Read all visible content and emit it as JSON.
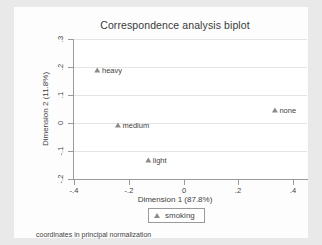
{
  "chart_data": {
    "type": "scatter",
    "title": "Correspondence analysis biplot",
    "xlabel": "Dimension 1 (87.8%)",
    "ylabel": "Dimension 2 (11.8%)",
    "xlim": [
      -0.4,
      0.45
    ],
    "ylim": [
      -0.2,
      0.3
    ],
    "xticks": [
      "-.4",
      "-.2",
      "0",
      ".2",
      ".4"
    ],
    "xtick_values": [
      -0.4,
      -0.2,
      0,
      0.2,
      0.4
    ],
    "yticks": [
      ".3",
      ".2",
      ".1",
      "0",
      "-.1",
      "-.2"
    ],
    "ytick_values": [
      0.3,
      0.2,
      0.1,
      0,
      -0.1,
      -0.2
    ],
    "grid": "horizontal",
    "legend_position": "bottom",
    "series": [
      {
        "name": "smoking",
        "marker": "triangle",
        "color": "#8b8b8b",
        "points": [
          {
            "label": "heavy",
            "x": -0.275,
            "y": 0.191
          },
          {
            "label": "medium",
            "x": -0.188,
            "y": -0.008
          },
          {
            "label": "light",
            "x": -0.101,
            "y": -0.131
          },
          {
            "label": "none",
            "x": 0.366,
            "y": 0.046
          }
        ]
      }
    ],
    "note": "coordinates in principal normalization"
  },
  "legend": {
    "entries": [
      {
        "label": "smoking"
      }
    ]
  },
  "colors": {
    "figure_background": "#e9e9e9",
    "graph_background": "#fdfdfd",
    "plot_background": "#ffffff",
    "gridline": "#e4e4e4",
    "axis": "#9a9a9a",
    "text": "#3f3f3f",
    "marker": "#8b8b8b"
  }
}
